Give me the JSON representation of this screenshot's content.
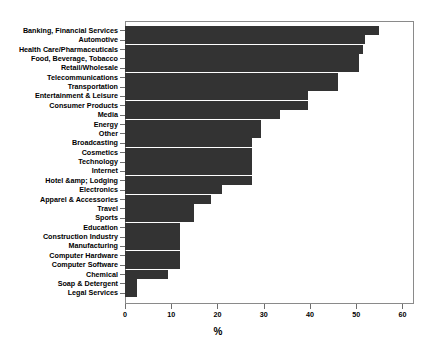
{
  "chart_data": {
    "type": "bar",
    "orientation": "horizontal",
    "title": "",
    "subtitle": "",
    "xlabel": "%",
    "ylabel": "",
    "xlim": [
      0,
      62.5
    ],
    "ylim": null,
    "grid": false,
    "legend": null,
    "xticks": [
      0,
      10,
      20,
      30,
      40,
      50,
      60
    ],
    "xtick_labels": [
      "0",
      "10",
      "20",
      "30",
      "40",
      "50",
      "60"
    ],
    "bar_color": "#333333",
    "categories": [
      "Banking, Financial Services",
      "Automotive",
      "Health Care/Pharmaceuticals",
      "Food, Beverage, Tobacco",
      "Retail/Wholesale",
      "Telecommunications",
      "Transportation",
      "Entertainment & Leisure",
      "Consumer Products",
      "Media",
      "Energy",
      "Other",
      "Broadcasting",
      "Cosmetics",
      "Technology",
      "Internet",
      "Hotel &amp; Lodging",
      "Electronics",
      "Apparel & Accessories",
      "Travel",
      "Sports",
      "Education",
      "Construction Industry",
      "Manufacturing",
      "Computer Hardware",
      "Computer Software",
      "Chemical",
      "Soap & Detergent",
      "Legal Services"
    ],
    "values": [
      55,
      52,
      51.5,
      50.5,
      50.5,
      46,
      46,
      39.5,
      39.5,
      33.5,
      29.5,
      29.5,
      27.5,
      27.5,
      27.5,
      27.5,
      27.5,
      21,
      18.5,
      15,
      15,
      12,
      12,
      12,
      12,
      12,
      9.2,
      2.6,
      2.6
    ],
    "annotations": []
  },
  "axes": {
    "x_axis_title": "%",
    "y_axis_title": ""
  }
}
